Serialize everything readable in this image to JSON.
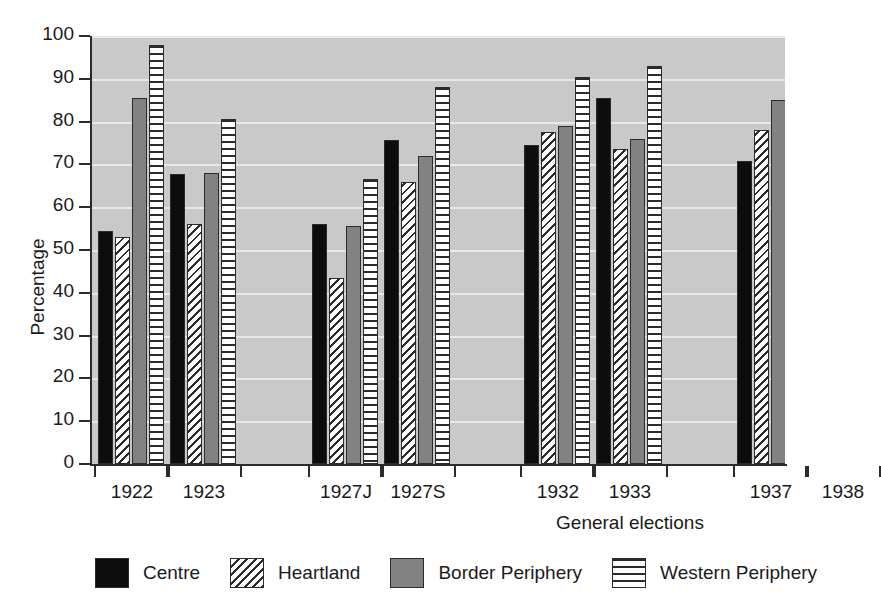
{
  "chart_data": {
    "type": "bar",
    "title": "",
    "xlabel": "General elections",
    "ylabel": "Percentage",
    "ylim": [
      0,
      100
    ],
    "yticks": [
      0,
      10,
      20,
      30,
      40,
      50,
      60,
      70,
      80,
      90,
      100
    ],
    "grid": true,
    "legend_position": "bottom",
    "categories": [
      "1922",
      "1923",
      "1927J",
      "1927S",
      "1932",
      "1933",
      "1937",
      "1938"
    ],
    "series": [
      {
        "name": "Centre",
        "pattern": "solid-black",
        "color": "#0d0d0d",
        "values": [
          54.5,
          67.8,
          56.0,
          75.7,
          74.5,
          85.5,
          70.8,
          83.0
        ]
      },
      {
        "name": "Heartland",
        "pattern": "diagonal-hatch",
        "color": "#ffffff",
        "values": [
          53.0,
          56.0,
          43.5,
          66.0,
          77.5,
          73.5,
          78.0,
          81.5
        ]
      },
      {
        "name": "Border Periphery",
        "pattern": "solid-gray",
        "color": "#828282",
        "values": [
          85.5,
          68.0,
          55.5,
          72.0,
          79.0,
          76.0,
          85.0,
          91.0
        ]
      },
      {
        "name": "Western  Periphery",
        "pattern": "horizontal-stripes",
        "color": "#ffffff",
        "values": [
          98.0,
          80.5,
          66.5,
          88.0,
          90.5,
          93.0,
          89.0,
          92.5
        ]
      }
    ]
  },
  "style": {
    "plot_background": "#c9c9c9",
    "gridline_color": "#e8e8e8",
    "axis_color": "#2b2b2b",
    "page_background": "#ffffff"
  }
}
